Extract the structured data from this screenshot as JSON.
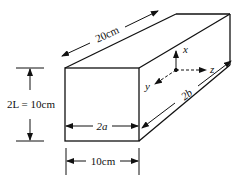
{
  "diagram": {
    "type": "rectangular-bar-geometry",
    "colors": {
      "stroke": "#111111",
      "background": "#ffffff"
    },
    "dimensions": {
      "length": {
        "label": "20cm"
      },
      "height": {
        "label": "2L = 10cm"
      },
      "width": {
        "label": "10cm"
      },
      "inner_width": {
        "label": "2a"
      },
      "depth": {
        "label": "2b"
      }
    },
    "axes": {
      "x": {
        "label": "x"
      },
      "y": {
        "label": "y"
      },
      "z": {
        "label": "z"
      }
    }
  }
}
